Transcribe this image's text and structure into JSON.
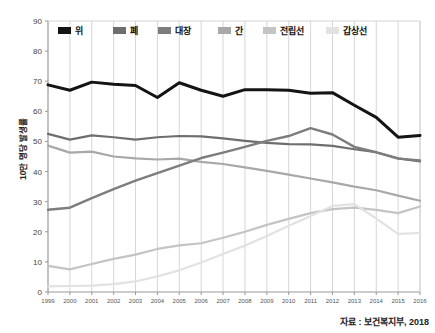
{
  "chart_data": {
    "type": "line",
    "title": "",
    "xlabel": "",
    "ylabel": "10만 명당 발생률",
    "source_note": "자료 : 보건복지부, 2018",
    "ylim": [
      0,
      90
    ],
    "y_ticks": [
      0,
      10,
      20,
      30,
      40,
      50,
      60,
      70,
      80,
      90
    ],
    "grid": "vertical",
    "legend_position": "top-inside",
    "categories": [
      "1999",
      "2000",
      "2001",
      "2002",
      "2003",
      "2004",
      "2005",
      "2006",
      "2007",
      "2008",
      "2009",
      "2010",
      "2011",
      "2012",
      "2013",
      "2014",
      "2015",
      "2016"
    ],
    "series": [
      {
        "name": "위",
        "color": "#141414",
        "width": 3.0,
        "values": [
          68.8,
          67.0,
          69.7,
          69.0,
          68.6,
          64.6,
          69.5,
          67.0,
          65.0,
          67.2,
          67.2,
          67.0,
          66.0,
          66.2,
          62.0,
          58.0,
          51.4,
          52.0
        ]
      },
      {
        "name": "폐",
        "color": "#6e6e6e",
        "width": 2.2,
        "values": [
          52.5,
          50.6,
          52.0,
          51.4,
          50.6,
          51.4,
          51.8,
          51.7,
          51.0,
          50.2,
          49.5,
          49.1,
          49.0,
          48.5,
          47.4,
          46.4,
          44.4,
          43.4
        ]
      },
      {
        "name": "대장",
        "color": "#7d7d7d",
        "width": 2.4,
        "values": [
          27.3,
          28.0,
          31.2,
          34.2,
          37.0,
          39.5,
          42.0,
          44.5,
          46.3,
          48.2,
          50.2,
          51.8,
          54.4,
          52.3,
          48.2,
          46.4,
          44.3,
          43.7
        ]
      },
      {
        "name": "간",
        "color": "#a8a8a8",
        "width": 2.2,
        "values": [
          48.6,
          46.3,
          46.6,
          45.0,
          44.4,
          44.0,
          44.3,
          43.2,
          42.5,
          41.4,
          40.2,
          39.0,
          37.7,
          36.4,
          35.0,
          33.8,
          32.0,
          30.3
        ]
      },
      {
        "name": "전립선",
        "color": "#c4c4c4",
        "width": 2.2,
        "values": [
          8.7,
          7.5,
          9.3,
          11.0,
          12.4,
          14.3,
          15.5,
          16.2,
          18.0,
          20.0,
          22.3,
          24.3,
          26.2,
          27.5,
          28.0,
          27.3,
          26.2,
          28.4
        ]
      },
      {
        "name": "갑상선",
        "color": "#e2e2e2",
        "width": 2.2,
        "values": [
          1.9,
          2.0,
          2.1,
          2.6,
          3.5,
          5.2,
          7.2,
          9.8,
          12.6,
          15.4,
          18.6,
          22.0,
          25.2,
          28.6,
          29.2,
          24.4,
          19.3,
          19.6
        ]
      }
    ]
  },
  "legend": {
    "items": [
      {
        "label": "위",
        "color": "#141414"
      },
      {
        "label": "폐",
        "color": "#6e6e6e"
      },
      {
        "label": "대장",
        "color": "#7d7d7d"
      },
      {
        "label": "간",
        "color": "#a8a8a8"
      },
      {
        "label": "전립선",
        "color": "#c4c4c4"
      },
      {
        "label": "갑상선",
        "color": "#e2e2e2"
      }
    ]
  },
  "axes": {
    "y_title": "10만 명당 발생률"
  },
  "footer": {
    "source": "자료 : 보건복지부, 2018"
  }
}
